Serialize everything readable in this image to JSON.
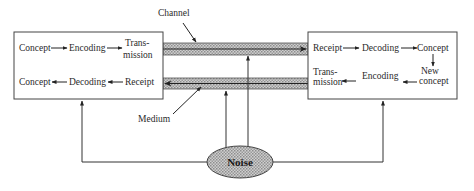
{
  "diagram": {
    "type": "communication-model",
    "sender_box": {
      "row1": [
        "Concept",
        "Encoding",
        "Trans-",
        "mission"
      ],
      "row2": [
        "Concept",
        "Decoding",
        "Receipt"
      ]
    },
    "receiver_box": {
      "row1": [
        "Receipt",
        "Decoding",
        "Concept"
      ],
      "row2_left": [
        "Trans-",
        "mission"
      ],
      "row2_mid": "Encoding",
      "row2_right": [
        "New",
        "concept"
      ]
    },
    "labels": {
      "channel": "Channel",
      "medium": "Medium",
      "noise": "Noise"
    },
    "colors": {
      "line": "#333333",
      "fill_hatch": "#b8b8b8",
      "background": "#ffffff"
    }
  }
}
